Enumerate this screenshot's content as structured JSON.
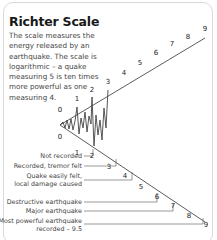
{
  "panel": {
    "title": "Richter Scale",
    "description": "The scale measures the energy released by an earthquake. The scale is logarithmic – a quake measuring 5 is ten times more powerful as one measuring 4."
  },
  "scale": {
    "top_numbers": [
      "0",
      "1",
      "2",
      "3",
      "4",
      "5",
      "6",
      "7",
      "8",
      "9"
    ],
    "bottom_numbers": [
      "0",
      "1",
      "2",
      "3",
      "4",
      "5",
      "6",
      "7",
      "8",
      "9"
    ]
  },
  "labels": {
    "not_recorded": "Not recorded",
    "tremor_felt": "Recorded, tremor felt",
    "easily_felt_line1": "Quake easily felt,",
    "easily_felt_line2": "local damage caused",
    "destructive": "Destructive earthquake",
    "major": "Major earthquake",
    "most_powerful_line1": "Most powerful earthquake",
    "most_powerful_line2": "recorded – 9.5"
  },
  "colors": {
    "line": "#333333",
    "wave": "#555555",
    "border": "#d9d9d9"
  }
}
